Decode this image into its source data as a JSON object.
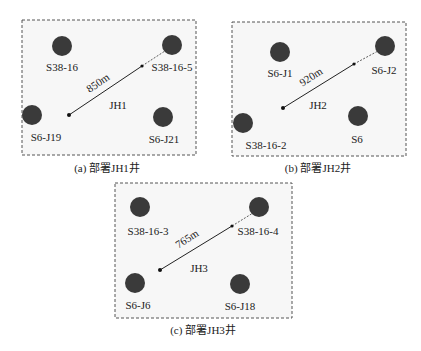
{
  "panels": [
    {
      "caption": "(a) 部署JH1井",
      "new_well": "JH1",
      "distance": "850m",
      "wells": [
        "S38-16",
        "S38-16-5",
        "S6-J19",
        "S6-J21"
      ]
    },
    {
      "caption": "(b) 部署JH2井",
      "new_well": "JH2",
      "distance": "920m",
      "wells": [
        "S6-J1",
        "S6-J2",
        "S38-16-2",
        "S6"
      ]
    },
    {
      "caption": "(c) 部署JH3井",
      "new_well": "JH3",
      "distance": "765m",
      "wells": [
        "S38-16-3",
        "S38-16-4",
        "S6-J6",
        "S6-J18"
      ]
    }
  ],
  "colors": {
    "well": "#3a3a3a",
    "panel_bg": "#f7f7f7",
    "border": "#555555"
  }
}
